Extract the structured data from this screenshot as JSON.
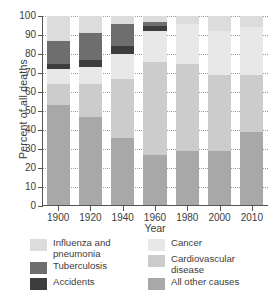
{
  "chart_data": {
    "type": "bar",
    "subtype": "stacked-bar-percent",
    "title": "",
    "xlabel": "Year",
    "ylabel": "Percent of all deaths",
    "ylim": [
      0,
      100
    ],
    "yticks": [
      0,
      10,
      20,
      30,
      40,
      50,
      60,
      70,
      80,
      90,
      100
    ],
    "grid": "horizontal-dotted",
    "legend_position": "below-plot",
    "categories": [
      "1900",
      "1920",
      "1940",
      "1960",
      "1980",
      "2000",
      "2010"
    ],
    "stack_order_bottom_to_top": [
      "All other causes",
      "Cardiovascular disease",
      "Cancer",
      "Accidents",
      "Tuberculosis",
      "Influenza and pneumonia"
    ],
    "series": [
      {
        "name": "All other causes",
        "color": "#a8a8a8",
        "values": [
          53,
          47,
          36,
          27,
          29,
          29,
          39
        ]
      },
      {
        "name": "Cardiovascular disease",
        "color": "#cccccc",
        "values": [
          11,
          17,
          31,
          49,
          46,
          40,
          30
        ]
      },
      {
        "name": "Cancer",
        "color": "#e8e8e8",
        "values": [
          8,
          9,
          13,
          16,
          21,
          23,
          25
        ]
      },
      {
        "name": "Accidents",
        "color": "#3d3d3d",
        "values": [
          3,
          4,
          4,
          3,
          0,
          0,
          0
        ]
      },
      {
        "name": "Tuberculosis",
        "color": "#6e6e6e",
        "values": [
          12,
          14,
          12,
          2,
          0,
          0,
          0
        ]
      },
      {
        "name": "Influenza and pneumonia",
        "color": "#dcdcdc",
        "values": [
          13,
          9,
          4,
          3,
          4,
          8,
          6
        ]
      }
    ],
    "cumulative_tops": {
      "1900": [
        53,
        64,
        72,
        75,
        87,
        100
      ],
      "1920": [
        47,
        64,
        73,
        77,
        91,
        100
      ],
      "1940": [
        36,
        67,
        80,
        84,
        96,
        100
      ],
      "1960": [
        27,
        76,
        92,
        95,
        97,
        100
      ],
      "1980": [
        29,
        75,
        96,
        96,
        96,
        100
      ],
      "2000": [
        29,
        69,
        92,
        92,
        92,
        100
      ],
      "2010": [
        39,
        69,
        94,
        94,
        94,
        100
      ]
    }
  },
  "axes": {
    "ylabel": "Percent of all deaths",
    "xlabel": "Year",
    "ytick_labels": [
      "100",
      "90",
      "80",
      "70",
      "60",
      "50",
      "40",
      "30",
      "20",
      "10",
      "0"
    ],
    "xtick_labels": [
      "1900",
      "1920",
      "1940",
      "1960",
      "1980",
      "2000",
      "2010"
    ]
  },
  "legend": {
    "left_column": [
      {
        "label_line1": "Influenza and",
        "label_line2": "pneumonia",
        "color": "#dcdcdc"
      },
      {
        "label_line1": "Tuberculosis",
        "label_line2": "",
        "color": "#6e6e6e"
      },
      {
        "label_line1": "Accidents",
        "label_line2": "",
        "color": "#3d3d3d"
      }
    ],
    "right_column": [
      {
        "label_line1": "Cancer",
        "label_line2": "",
        "color": "#e8e8e8"
      },
      {
        "label_line1": "Cardiovascular",
        "label_line2": "disease",
        "color": "#cccccc"
      },
      {
        "label_line1": "All other causes",
        "label_line2": "",
        "color": "#a8a8a8"
      }
    ]
  }
}
